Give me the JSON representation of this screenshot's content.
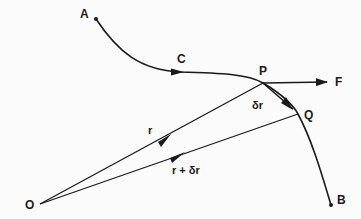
{
  "diagram": {
    "points": {
      "A": {
        "label": "A",
        "x": 96,
        "y": 19
      },
      "C": {
        "label": "C",
        "x": 178,
        "y": 72
      },
      "P": {
        "label": "P",
        "x": 263,
        "y": 83
      },
      "Q": {
        "label": "Q",
        "x": 298,
        "y": 114
      },
      "B": {
        "label": "B",
        "x": 331,
        "y": 205
      },
      "O": {
        "label": "O",
        "x": 40,
        "y": 204
      },
      "F": {
        "label": "F",
        "x": 325,
        "y": 82
      }
    },
    "vectors": {
      "r": {
        "label": "r"
      },
      "r_plus_dr": {
        "label": "r + δr"
      },
      "dr": {
        "label": "δr"
      },
      "force": {
        "label": "F"
      }
    },
    "colors": {
      "stroke": "#1a1a1a",
      "background": "#fbfbfb"
    }
  }
}
